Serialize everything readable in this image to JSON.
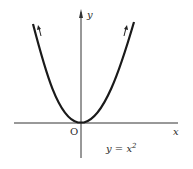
{
  "figure": {
    "axes": {
      "x_label": "x",
      "y_label": "y",
      "origin_label": "O"
    },
    "curve": {
      "equation_lhs": "y",
      "equation_eq": "=",
      "equation_rhs": "x",
      "equation_exp": "2",
      "stroke_color": "#1a1a1a"
    },
    "colors": {
      "background": "#ffffff",
      "axis": "#333333"
    }
  }
}
